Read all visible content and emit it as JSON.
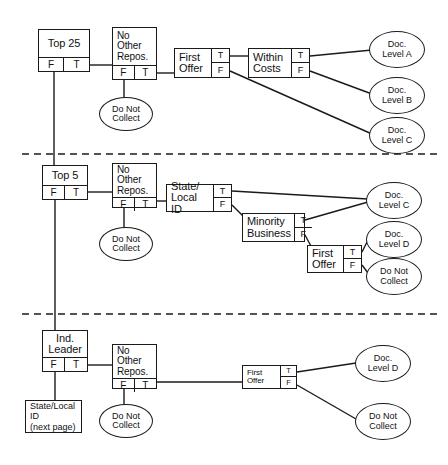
{
  "diagram": {
    "branch_labels": {
      "false": "F",
      "true": "T"
    },
    "sections": [
      {
        "id": "top25",
        "nodes": {
          "root": "Top 25",
          "no_other_repos": "No\nOther\nRepos.",
          "first_offer": "First\nOffer",
          "within_costs": "Within\nCosts"
        },
        "terminals": {
          "do_not_collect": "Do Not\nCollect",
          "doc_a": "Doc.\nLevel A",
          "doc_b": "Doc.\nLevel B",
          "doc_c": "Doc.\nLevel C"
        }
      },
      {
        "id": "top5",
        "nodes": {
          "root": "Top 5",
          "no_other_repos": "No\nOther\nRepos.",
          "state_local_id": "State/\nLocal ID",
          "minority_business": "Minority\nBusiness",
          "first_offer": "First\nOffer"
        },
        "terminals": {
          "do_not_collect": "Do Not\nCollect",
          "doc_c": "Doc.\nLevel C",
          "doc_d": "Doc.\nLevel D",
          "do_not_collect_2": "Do Not\nCollect"
        }
      },
      {
        "id": "ind_leader",
        "nodes": {
          "root": "Ind.\nLeader",
          "no_other_repos": "No\nOther\nRepos.",
          "first_offer": "First\nOffer"
        },
        "terminals": {
          "state_local_next_page": "State/Local\nID\n(next page)",
          "do_not_collect": "Do Not\nCollect",
          "doc_d": "Doc.\nLevel D",
          "do_not_collect_2": "Do Not\nCollect"
        }
      }
    ],
    "colors": {
      "stroke": "#1a1a1a",
      "background": "#ffffff"
    }
  }
}
